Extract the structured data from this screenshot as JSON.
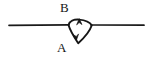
{
  "figure": {
    "type": "line-diagram",
    "background_color": "#ffffff",
    "stroke_color": "#161616",
    "canvas": {
      "width": 151,
      "height": 57
    },
    "labels": {
      "top": "B",
      "bottom": "A"
    },
    "elements": {
      "left_segment_name": "left-horizontal-line",
      "right_segment_name": "right-horizontal-line",
      "loop_name": "teardrop-loop",
      "top_arrow_name": "up-arrowhead",
      "bottom_arrow_name": "down-arrowhead"
    },
    "geometry": {
      "baseline_y": 25,
      "left_line": {
        "x1": 9,
        "y1": 25,
        "x2": 68,
        "y2": 25
      },
      "right_line": {
        "x1": 92,
        "y1": 25,
        "x2": 144,
        "y2": 25
      },
      "loop_top_left": {
        "x": 68,
        "y": 25
      },
      "loop_apex": {
        "x": 79,
        "y": 20
      },
      "loop_top_right": {
        "x": 92,
        "y": 25
      },
      "loop_bottom_tip": {
        "x": 78,
        "y": 43
      },
      "top_arrow_at": {
        "x": 79,
        "y": 21,
        "direction": "up"
      },
      "bottom_arrow_at": {
        "x": 76,
        "y": 38,
        "direction": "down"
      }
    }
  }
}
